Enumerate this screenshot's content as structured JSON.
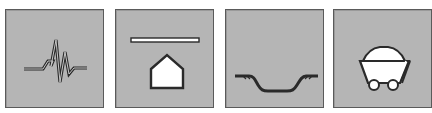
{
  "tiles": [
    {
      "id": "t1",
      "icon": "seismic-waveform-icon"
    },
    {
      "id": "t2",
      "icon": "house-subsidence-icon"
    },
    {
      "id": "t3",
      "icon": "ground-depression-icon"
    },
    {
      "id": "t4",
      "icon": "mine-cart-icon"
    }
  ],
  "colors": {
    "tile_fill": "#b5b5b5",
    "tile_border": "#5a5a5a",
    "icon_stroke": "#2a2a2a",
    "icon_fill": "#ffffff"
  }
}
